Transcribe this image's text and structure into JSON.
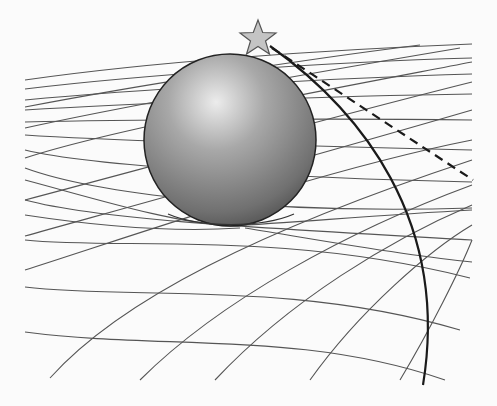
{
  "diagram": {
    "type": "spacetime-curvature-illustration",
    "background": "#fbfbfb",
    "grid_color": "#555555",
    "sphere": {
      "cx": 230,
      "cy": 150,
      "r": 86,
      "highlight": "#e6e6e6",
      "base": "#8a8a8a",
      "shadow": "#4a4a4a",
      "outline": "#222222"
    },
    "star": {
      "cx": 258,
      "cy": 38,
      "fill": "#c4c4c4",
      "stroke": "#555555"
    },
    "bent_path": {
      "description": "actual curved light path",
      "color": "#1a1a1a",
      "style": "solid"
    },
    "straight_path": {
      "description": "apparent straight path",
      "color": "#1a1a1a",
      "style": "dashed"
    }
  }
}
